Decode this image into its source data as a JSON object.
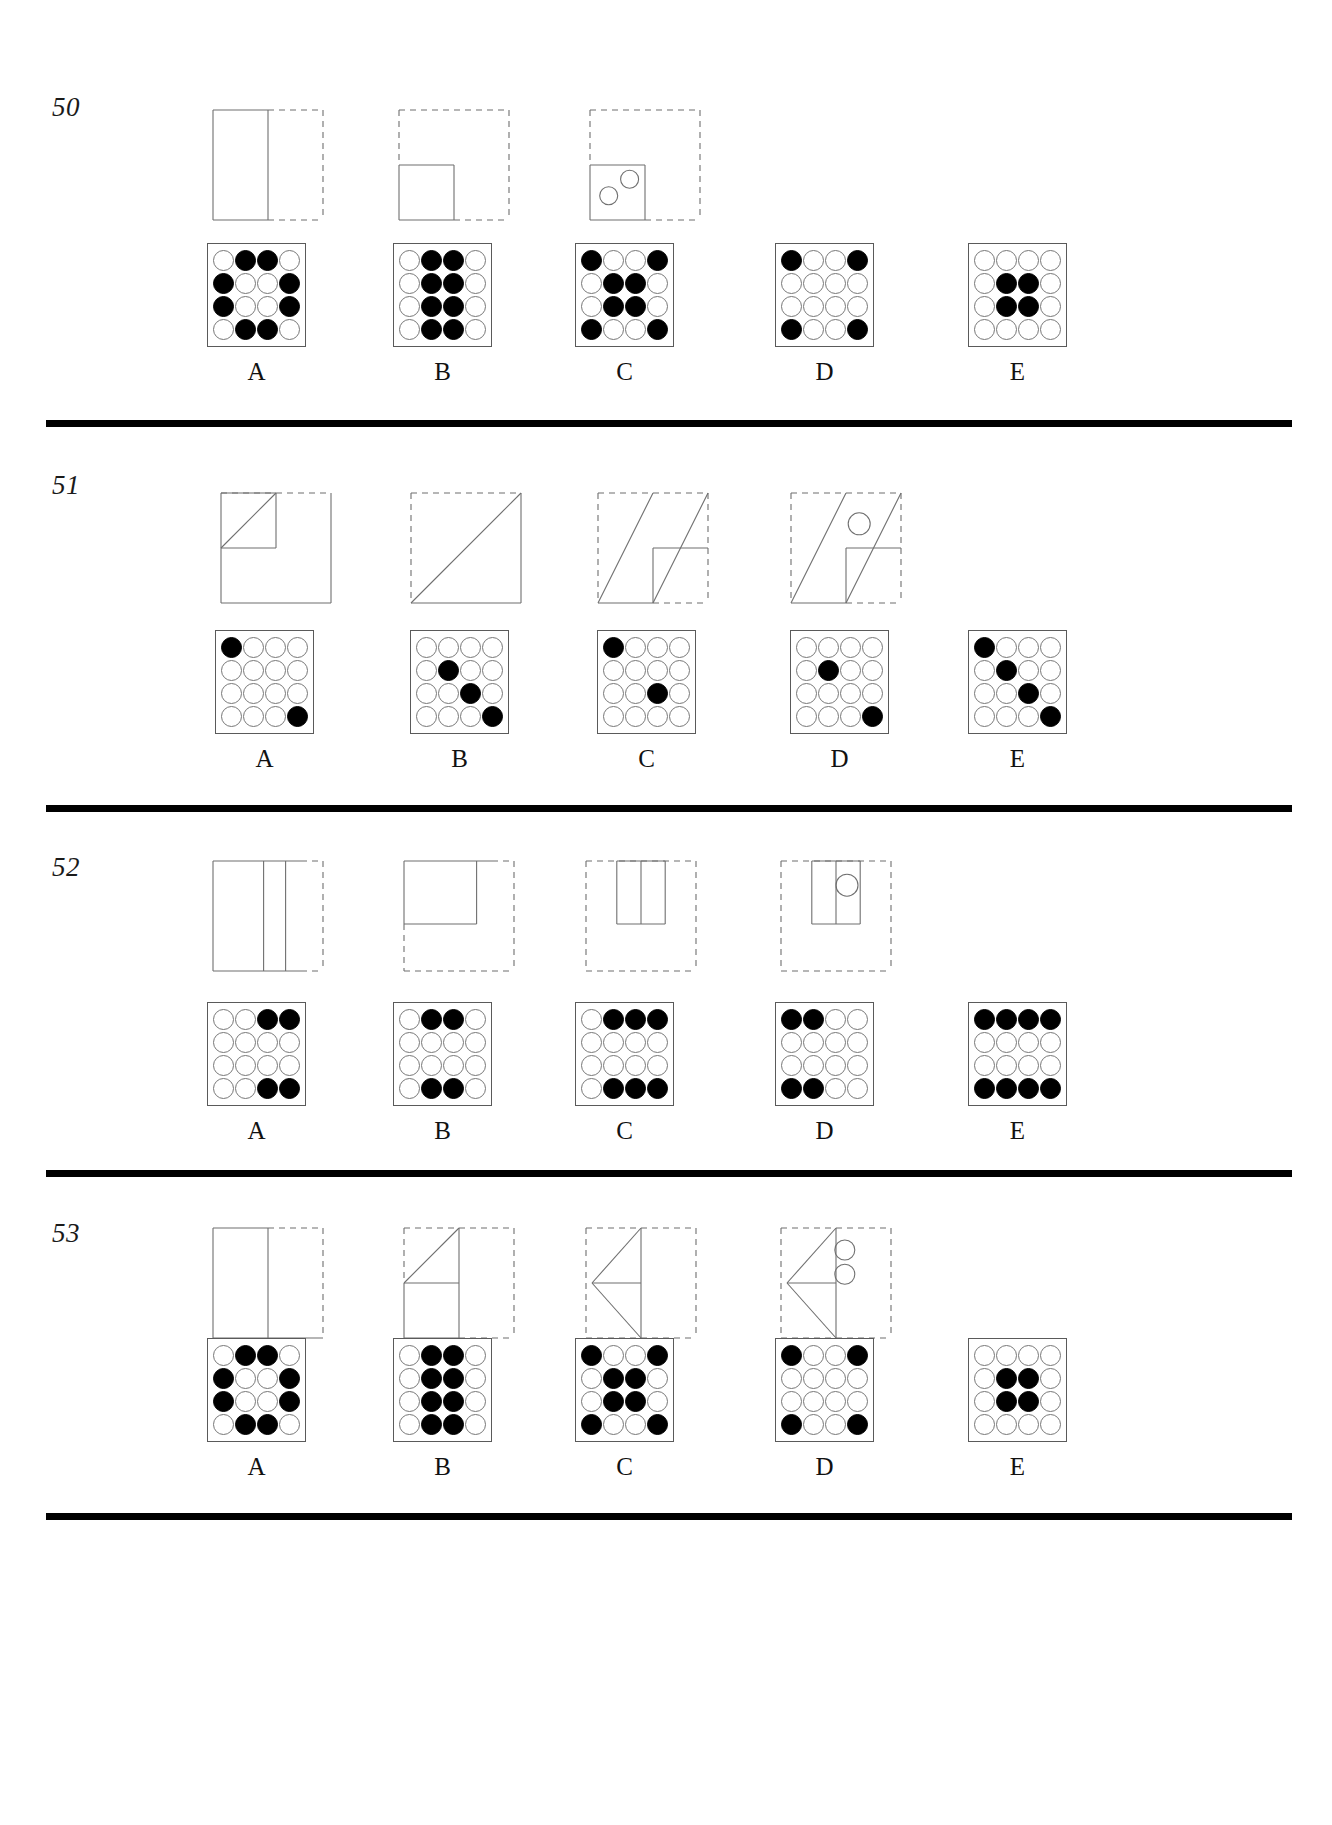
{
  "page": {
    "background_color": "#ffffff",
    "ink_color": "#000000",
    "grid_outline_color": "#5a5a5a",
    "open_dot_color": "#ffffff",
    "filled_dot_color": "#000000"
  },
  "option_labels": [
    "A",
    "B",
    "C",
    "D",
    "E"
  ],
  "problems": [
    {
      "number": "50",
      "stimulus": [
        {
          "name": "figure-1",
          "outer": "solid-left-dashed-right",
          "description": "square with solid left half outlined, vertical divider at middle, right half dashed",
          "edges": {
            "top_left": "solid",
            "top_right": "dashed",
            "left": "solid",
            "right": "dashed",
            "bottom_left": "solid",
            "bottom_right": "dashed"
          },
          "inner": [
            {
              "shape": "line",
              "from": "mid-top",
              "to": "mid-bottom"
            }
          ],
          "circles": []
        },
        {
          "name": "figure-2",
          "outer": "all-dashed",
          "description": "dashed square with a solid small square occupying the lower-left quadrant",
          "edges": {
            "top": "dashed",
            "left_upper": "dashed",
            "left_lower": "solid",
            "right": "dashed",
            "bottom_left": "solid",
            "bottom_right": "dashed"
          },
          "inner": [
            {
              "shape": "rect",
              "quadrant": "lower-left"
            }
          ],
          "circles": []
        },
        {
          "name": "figure-3",
          "outer": "all-dashed",
          "description": "dashed square with solid small square in lower-left quadrant containing two small circles",
          "edges": {
            "top": "dashed",
            "right": "dashed",
            "bottom_right": "dashed"
          },
          "inner": [
            {
              "shape": "rect",
              "quadrant": "lower-left"
            }
          ],
          "circles": [
            {
              "cx_frac": 0.36,
              "cy_frac": 0.4,
              "r": 9
            },
            {
              "cx_frac": 0.17,
              "cy_frac": 0.55,
              "r": 9
            }
          ]
        },
        {
          "name": "figure-4",
          "outer": "none",
          "description": "blank / missing fourth term",
          "edges": {},
          "inner": [],
          "circles": []
        }
      ],
      "options": [
        {
          "label": "A",
          "grid": [
            [
              0,
              1,
              1,
              0
            ],
            [
              1,
              0,
              0,
              1
            ],
            [
              1,
              0,
              0,
              1
            ],
            [
              0,
              1,
              1,
              0
            ]
          ]
        },
        {
          "label": "B",
          "grid": [
            [
              0,
              1,
              1,
              0
            ],
            [
              0,
              1,
              1,
              0
            ],
            [
              0,
              1,
              1,
              0
            ],
            [
              0,
              1,
              1,
              0
            ]
          ]
        },
        {
          "label": "C",
          "grid": [
            [
              1,
              0,
              0,
              1
            ],
            [
              0,
              1,
              1,
              0
            ],
            [
              0,
              1,
              1,
              0
            ],
            [
              1,
              0,
              0,
              1
            ]
          ]
        },
        {
          "label": "D",
          "grid": [
            [
              1,
              0,
              0,
              1
            ],
            [
              0,
              0,
              0,
              0
            ],
            [
              0,
              0,
              0,
              0
            ],
            [
              1,
              0,
              0,
              1
            ]
          ]
        },
        {
          "label": "E",
          "grid": [
            [
              0,
              0,
              0,
              0
            ],
            [
              0,
              1,
              1,
              0
            ],
            [
              0,
              1,
              1,
              0
            ],
            [
              0,
              0,
              0,
              0
            ]
          ]
        }
      ]
    },
    {
      "number": "51",
      "stimulus": [
        {
          "name": "figure-1",
          "outer": "dashed-top-solid-rest",
          "description": "square, top edge dashed; small diagonal from upper-left to top-middle with an L shaped inner box",
          "edges": {
            "top": "dashed",
            "left": "solid",
            "right": "solid",
            "bottom": "solid"
          },
          "inner": [
            {
              "shape": "diagonal-small",
              "from": "top-left",
              "to": "mid-top"
            },
            {
              "shape": "rect",
              "quadrant": "upper-left"
            }
          ],
          "circles": []
        },
        {
          "name": "figure-2",
          "outer": "dashed-top-left-solid-rest",
          "description": "square with full diagonal from lower-left to upper-right",
          "edges": {
            "top": "dashed",
            "left": "dashed",
            "right": "solid",
            "bottom": "solid"
          },
          "inner": [
            {
              "shape": "diagonal-full",
              "from": "bottom-left",
              "to": "top-right"
            }
          ],
          "circles": []
        },
        {
          "name": "figure-3",
          "outer": "dashed-top-left-right-partial",
          "description": "square with full diagonal plus a second parallel diagonal and a horizontal mid line on the right",
          "edges": {
            "top": "dashed",
            "left": "dashed",
            "right": "dashed",
            "bottom_right": "dashed"
          },
          "inner": [
            {
              "shape": "diagonal-full",
              "from": "bottom-left",
              "to": "top-right"
            },
            {
              "shape": "diagonal-parallel"
            },
            {
              "shape": "hline",
              "at": "middle-right"
            }
          ],
          "circles": []
        },
        {
          "name": "figure-4",
          "outer": "dashed",
          "description": "dashed square with two parallel diagonals, middle horizontal line and a small circle between the diagonals",
          "edges": {
            "top": "dashed",
            "left": "dashed",
            "right": "dashed",
            "bottom_right": "dashed"
          },
          "inner": [
            {
              "shape": "diagonal-full",
              "from": "bottom-left",
              "to": "top-right"
            },
            {
              "shape": "diagonal-parallel"
            },
            {
              "shape": "hline",
              "at": "middle-right"
            }
          ],
          "circles": [
            {
              "cx_frac": 0.58,
              "cy_frac": 0.3,
              "r": 11
            }
          ]
        }
      ],
      "options": [
        {
          "label": "A",
          "grid": [
            [
              1,
              0,
              0,
              0
            ],
            [
              0,
              0,
              0,
              0
            ],
            [
              0,
              0,
              0,
              0
            ],
            [
              0,
              0,
              0,
              1
            ]
          ]
        },
        {
          "label": "B",
          "grid": [
            [
              0,
              0,
              0,
              0
            ],
            [
              0,
              1,
              0,
              0
            ],
            [
              0,
              0,
              1,
              0
            ],
            [
              0,
              0,
              0,
              1
            ]
          ]
        },
        {
          "label": "C",
          "grid": [
            [
              1,
              0,
              0,
              0
            ],
            [
              0,
              0,
              0,
              0
            ],
            [
              0,
              0,
              1,
              0
            ],
            [
              0,
              0,
              0,
              0
            ]
          ]
        },
        {
          "label": "D",
          "grid": [
            [
              0,
              0,
              0,
              0
            ],
            [
              0,
              1,
              0,
              0
            ],
            [
              0,
              0,
              0,
              0
            ],
            [
              0,
              0,
              0,
              1
            ]
          ]
        },
        {
          "label": "E",
          "grid": [
            [
              1,
              0,
              0,
              0
            ],
            [
              0,
              1,
              0,
              0
            ],
            [
              0,
              0,
              1,
              0
            ],
            [
              0,
              0,
              0,
              1
            ]
          ]
        }
      ]
    },
    {
      "number": "52",
      "stimulus": [
        {
          "name": "figure-1",
          "outer": "solid-left-dashed-right",
          "description": "square with two vertical divider lines, right edge dashed",
          "edges": {
            "top": "solid",
            "left": "solid",
            "right": "dashed",
            "bottom": "solid"
          },
          "inner": [
            {
              "shape": "vline",
              "at": 0.5
            },
            {
              "shape": "vline",
              "at": 0.66
            }
          ],
          "circles": []
        },
        {
          "name": "figure-2",
          "outer": "dashed-bottom-right",
          "description": "dashed square with solid rectangle occupying the upper-left area",
          "edges": {
            "top": "solid",
            "left": "solid",
            "right": "dashed",
            "bottom": "dashed"
          },
          "inner": [
            {
              "shape": "rect",
              "quadrant": "upper-left-wide"
            }
          ],
          "circles": []
        },
        {
          "name": "figure-3",
          "outer": "all-dashed",
          "description": "dashed square with a narrow solid box in the upper-middle split by a vertical line",
          "edges": {
            "top": "dashed",
            "left": "dashed",
            "right": "dashed",
            "bottom": "dashed"
          },
          "inner": [
            {
              "shape": "rect",
              "quadrant": "upper-center"
            },
            {
              "shape": "vline-inner"
            }
          ],
          "circles": []
        },
        {
          "name": "figure-4",
          "outer": "all-dashed",
          "description": "dashed square with narrow solid box upper-middle containing a small circle",
          "edges": {
            "top": "dashed",
            "left": "dashed",
            "right": "dashed",
            "bottom": "dashed"
          },
          "inner": [
            {
              "shape": "rect",
              "quadrant": "upper-center"
            },
            {
              "shape": "vline-inner"
            }
          ],
          "circles": [
            {
              "cx_frac": 0.55,
              "cy_frac": 0.23,
              "r": 11
            }
          ]
        }
      ],
      "options": [
        {
          "label": "A",
          "grid": [
            [
              0,
              0,
              1,
              1
            ],
            [
              0,
              0,
              0,
              0
            ],
            [
              0,
              0,
              0,
              0
            ],
            [
              0,
              0,
              1,
              1
            ]
          ]
        },
        {
          "label": "B",
          "grid": [
            [
              0,
              1,
              1,
              0
            ],
            [
              0,
              0,
              0,
              0
            ],
            [
              0,
              0,
              0,
              0
            ],
            [
              0,
              1,
              1,
              0
            ]
          ]
        },
        {
          "label": "C",
          "grid": [
            [
              0,
              1,
              1,
              1
            ],
            [
              0,
              0,
              0,
              0
            ],
            [
              0,
              0,
              0,
              0
            ],
            [
              0,
              1,
              1,
              1
            ]
          ]
        },
        {
          "label": "D",
          "grid": [
            [
              1,
              1,
              0,
              0
            ],
            [
              0,
              0,
              0,
              0
            ],
            [
              0,
              0,
              0,
              0
            ],
            [
              1,
              1,
              0,
              0
            ]
          ]
        },
        {
          "label": "E",
          "grid": [
            [
              1,
              1,
              1,
              1
            ],
            [
              0,
              0,
              0,
              0
            ],
            [
              0,
              0,
              0,
              0
            ],
            [
              1,
              1,
              1,
              1
            ]
          ]
        }
      ]
    },
    {
      "number": "53",
      "stimulus": [
        {
          "name": "figure-1",
          "outer": "solid-left-dashed-right",
          "description": "square with a vertical divider at middle; right portion dashed",
          "edges": {
            "top_left": "solid",
            "top_right": "dashed",
            "left": "solid",
            "right": "dashed",
            "bottom": "solid"
          },
          "inner": [
            {
              "shape": "vline",
              "at": 0.5
            }
          ],
          "circles": []
        },
        {
          "name": "figure-2",
          "outer": "dashed-top-right",
          "description": "dashed square with a triangle in the upper-left formed by a diagonal and a horizontal mid-line",
          "edges": {
            "top": "dashed",
            "right": "dashed",
            "bottom_right": "dashed"
          },
          "inner": [
            {
              "shape": "diagonal-up-right"
            },
            {
              "shape": "hline",
              "at": "middle-left"
            },
            {
              "shape": "vline",
              "at": 0.5
            }
          ],
          "circles": []
        },
        {
          "name": "figure-3",
          "outer": "all-dashed",
          "description": "dashed square containing a left-pointing triangle with a horizontal mid-line",
          "edges": {
            "top": "dashed",
            "left": "dashed",
            "right": "dashed",
            "bottom": "dashed"
          },
          "inner": [
            {
              "shape": "triangle-left"
            },
            {
              "shape": "hline",
              "at": "middle"
            }
          ],
          "circles": []
        },
        {
          "name": "figure-4",
          "outer": "all-dashed",
          "description": "dashed square containing a left-pointing triangle with a horizontal mid-line and two small circles",
          "edges": {
            "top": "dashed",
            "left": "dashed",
            "right": "dashed",
            "bottom": "dashed"
          },
          "inner": [
            {
              "shape": "triangle-left"
            },
            {
              "shape": "hline",
              "at": "middle"
            }
          ],
          "circles": [
            {
              "cx_frac": 0.54,
              "cy_frac": 0.22,
              "r": 10
            },
            {
              "cx_frac": 0.54,
              "cy_frac": 0.44,
              "r": 10
            }
          ]
        }
      ],
      "options": [
        {
          "label": "A",
          "grid": [
            [
              0,
              1,
              1,
              0
            ],
            [
              1,
              0,
              0,
              1
            ],
            [
              1,
              0,
              0,
              1
            ],
            [
              0,
              1,
              1,
              0
            ]
          ]
        },
        {
          "label": "B",
          "grid": [
            [
              0,
              1,
              1,
              0
            ],
            [
              0,
              1,
              1,
              0
            ],
            [
              0,
              1,
              1,
              0
            ],
            [
              0,
              1,
              1,
              0
            ]
          ]
        },
        {
          "label": "C",
          "grid": [
            [
              1,
              0,
              0,
              1
            ],
            [
              0,
              1,
              1,
              0
            ],
            [
              0,
              1,
              1,
              0
            ],
            [
              1,
              0,
              0,
              1
            ]
          ]
        },
        {
          "label": "D",
          "grid": [
            [
              1,
              0,
              0,
              1
            ],
            [
              0,
              0,
              0,
              0
            ],
            [
              0,
              0,
              0,
              0
            ],
            [
              1,
              0,
              0,
              1
            ]
          ]
        },
        {
          "label": "E",
          "grid": [
            [
              0,
              0,
              0,
              0
            ],
            [
              0,
              1,
              1,
              0
            ],
            [
              0,
              1,
              1,
              0
            ],
            [
              0,
              0,
              0,
              0
            ]
          ]
        }
      ]
    }
  ]
}
